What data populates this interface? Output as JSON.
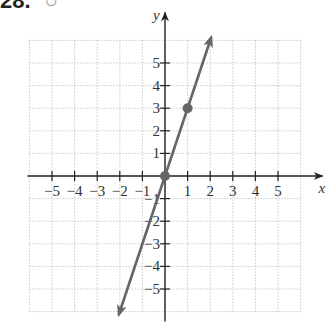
{
  "problem": {
    "number": "28.",
    "marker": "○"
  },
  "chart_data": {
    "type": "line",
    "title": "",
    "xlabel": "x",
    "ylabel": "y",
    "xlim": [
      -6,
      6
    ],
    "ylim": [
      -6,
      6
    ],
    "grid": true,
    "x_ticks": [
      -5,
      -4,
      -3,
      -2,
      -1,
      1,
      2,
      3,
      4,
      5
    ],
    "y_ticks": [
      -5,
      -4,
      -3,
      -2,
      -1,
      1,
      2,
      3,
      4,
      5
    ],
    "x_tick_labels": [
      "−5",
      "−4",
      "−3",
      "−2",
      "−1",
      "1",
      "2",
      "3",
      "4",
      "5"
    ],
    "y_tick_labels": [
      "−5",
      "−4",
      "−3",
      "−2",
      "−1",
      "1",
      "2",
      "3",
      "4",
      "5"
    ],
    "series": [
      {
        "name": "y = 3x",
        "equation": "y = 3x",
        "x": [
          -2.05,
          0,
          1,
          2.05
        ],
        "y": [
          -6.15,
          0,
          3,
          6.15
        ],
        "arrows": "both",
        "color": "#666666"
      }
    ],
    "points": [
      {
        "x": 0,
        "y": 0,
        "label": ""
      },
      {
        "x": 1,
        "y": 3,
        "label": ""
      }
    ]
  },
  "colors": {
    "line": "#666666",
    "axis": "#222222",
    "grid": "#bbbbbb"
  }
}
